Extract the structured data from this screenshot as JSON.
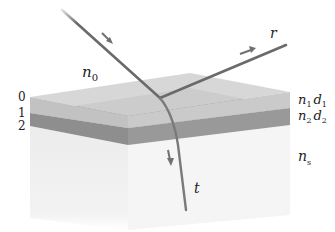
{
  "figure": {
    "colors": {
      "background": "#ffffff",
      "layer1_top": "#cfcfcf",
      "layer1_front": "#c4c4c4",
      "layer2_front": "#8e8e8e",
      "layer2_side": "#9a9a9a",
      "substrate_left": "#efefef",
      "substrate_right": "#f4f4f4",
      "ray": "#6a6a6a",
      "arrow": "#707070",
      "text": "#222222"
    },
    "labels": {
      "ambient_index": {
        "base": "n",
        "sub": "0"
      },
      "reflected": "r",
      "transmitted": "t",
      "layer1": {
        "n": "n",
        "n_sub": "1",
        "d": "d",
        "d_sub": "1"
      },
      "layer2": {
        "n": "n",
        "n_sub": "2",
        "d": "d",
        "d_sub": "2"
      },
      "substrate_index": {
        "base": "n",
        "sub": "s"
      }
    },
    "interface_numbers": [
      "0",
      "1",
      "2"
    ]
  }
}
